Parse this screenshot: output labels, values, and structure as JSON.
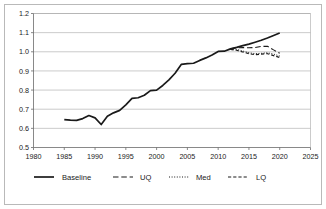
{
  "chart_data": {
    "type": "line",
    "title": "",
    "xlabel": "",
    "ylabel": "",
    "xlim": [
      1980,
      2025
    ],
    "ylim": [
      0.5,
      1.2
    ],
    "xticks": [
      1980,
      1985,
      1990,
      1995,
      2000,
      2005,
      2010,
      2015,
      2020,
      2025
    ],
    "yticks": [
      0.5,
      0.6,
      0.7,
      0.8,
      0.9,
      1.0,
      1.1,
      1.2
    ],
    "xtick_labels": [
      "1980",
      "1985",
      "1990",
      "1995",
      "2000",
      "2005",
      "2010",
      "2015",
      "2020",
      "2025"
    ],
    "ytick_labels": [
      "0.5",
      "0.6",
      "0.7",
      "0.8",
      "0.9",
      "1.0",
      "1.1",
      "1.2"
    ],
    "grid": true,
    "grid_axis": "y",
    "legend_position": "bottom",
    "series": [
      {
        "name": "Baseline",
        "style": "solid",
        "color": "#1a1a1a",
        "width": 1.7,
        "x": [
          1985,
          1986,
          1987,
          1988,
          1989,
          1990,
          1991,
          1992,
          1993,
          1994,
          1995,
          1996,
          1997,
          1998,
          1999,
          2000,
          2001,
          2002,
          2003,
          2004,
          2005,
          2006,
          2007,
          2008,
          2009,
          2010,
          2011,
          2012,
          2013,
          2014,
          2015,
          2016,
          2017,
          2018,
          2019,
          2020
        ],
        "values": [
          0.646,
          0.643,
          0.642,
          0.651,
          0.667,
          0.655,
          0.62,
          0.663,
          0.681,
          0.694,
          0.723,
          0.757,
          0.76,
          0.773,
          0.797,
          0.8,
          0.824,
          0.853,
          0.888,
          0.934,
          0.938,
          0.94,
          0.955,
          0.968,
          0.983,
          1.002,
          1.003,
          1.015,
          1.023,
          1.032,
          1.04,
          1.05,
          1.06,
          1.072,
          1.085,
          1.098
        ]
      },
      {
        "name": "UQ",
        "style": "longdash",
        "color": "#4a4a4a",
        "width": 1.1,
        "x": [
          2012,
          2013,
          2014,
          2015,
          2016,
          2017,
          2018,
          2019,
          2020
        ],
        "values": [
          1.015,
          1.021,
          1.022,
          1.021,
          1.022,
          1.028,
          1.029,
          1.01,
          0.992
        ]
      },
      {
        "name": "Med",
        "style": "dotted",
        "color": "#8a8a8a",
        "width": 1.0,
        "x": [
          2012,
          2013,
          2014,
          2015,
          2016,
          2017,
          2018,
          2019,
          2020
        ],
        "values": [
          1.015,
          1.013,
          1.004,
          0.995,
          0.99,
          0.992,
          0.995,
          0.988,
          0.978
        ]
      },
      {
        "name": "LQ",
        "style": "dashed",
        "color": "#1a1a1a",
        "width": 1.2,
        "x": [
          2012,
          2013,
          2014,
          2015,
          2016,
          2017,
          2018,
          2019,
          2020
        ],
        "values": [
          1.013,
          1.008,
          0.999,
          0.99,
          0.985,
          0.988,
          0.99,
          0.98,
          0.97
        ]
      }
    ],
    "legend": [
      {
        "label": "Baseline",
        "style": "solid"
      },
      {
        "label": "UQ",
        "style": "longdash"
      },
      {
        "label": "Med",
        "style": "dotted"
      },
      {
        "label": "LQ",
        "style": "dashed"
      }
    ]
  }
}
